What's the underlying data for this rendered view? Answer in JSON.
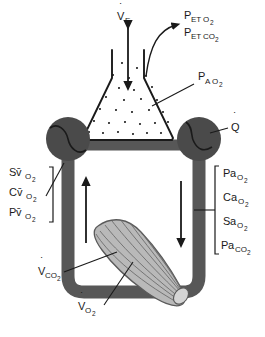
{
  "figure": {
    "background_color": "#ffffff"
  },
  "colors": {
    "vessel": "#575757",
    "heart": "#4a4a4a",
    "muscle_fill": "#b9b9b9",
    "muscle_stroke": "#5a5a5a",
    "outline": "#1a1a1a",
    "text": "#1a1a1a"
  },
  "labels": {
    "ventilation": {
      "base": "V",
      "dot": "˙",
      "sub": "E",
      "full": "V̇E"
    },
    "end_tidal": [
      {
        "base": "P",
        "sub1": "ET",
        "sub2": "O",
        "sub3": "2",
        "full": "PETO2"
      },
      {
        "base": "P",
        "sub1": "ET",
        "sub2": "CO",
        "sub3": "2",
        "full": "PETCO2"
      }
    ],
    "alveolar": {
      "base": "P",
      "sub1": "A",
      "sub2": "O",
      "sub3": "2",
      "full": "PAO2"
    },
    "cardiac_output": {
      "base": "Q",
      "dot": "˙",
      "full": "Q̇"
    },
    "venous": [
      {
        "base": "S",
        "sub1": "v̄",
        "sub2": "O",
        "sub3": "2",
        "full": "Sv̄O2"
      },
      {
        "base": "C",
        "sub1": "v̄",
        "sub2": "O",
        "sub3": "2",
        "full": "Cv̄O2"
      },
      {
        "base": "P",
        "sub1": "v̄",
        "sub2": "O",
        "sub3": "2",
        "full": "Pv̄O2"
      }
    ],
    "arterial": [
      {
        "base": "P",
        "sub1": "a",
        "sub2": "O",
        "sub3": "2",
        "full": "PaO2"
      },
      {
        "base": "C",
        "sub1": "a",
        "sub2": "O",
        "sub3": "2",
        "full": "CaO2"
      },
      {
        "base": "S",
        "sub1": "a",
        "sub2": "O",
        "sub3": "2",
        "full": "SaO2"
      },
      {
        "base": "P",
        "sub1": "a",
        "sub2": "CO",
        "sub3": "2",
        "full": "PaCO2"
      }
    ],
    "co2_production": {
      "base": "V",
      "dot": "˙",
      "sub1": "CO",
      "sub2": "2",
      "full": "V̇CO2"
    },
    "o2_consumption": {
      "base": "V",
      "dot": "˙",
      "sub1": "O",
      "sub2": "2",
      "full": "V̇O2"
    }
  },
  "elements": {
    "flask_name": "lung-flask",
    "left_heart_name": "heart-pump-left",
    "right_heart_name": "heart-pump-right",
    "muscle_name": "muscle-tissue",
    "venous_limb_name": "venous-limb",
    "arterial_limb_name": "arterial-limb"
  }
}
